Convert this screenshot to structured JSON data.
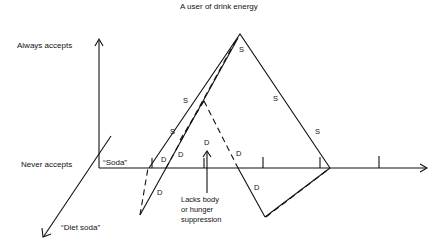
{
  "title": "A user of drink energy",
  "axes": {
    "y_top_label": "Always accepts",
    "y_bottom_label": "Never accepts",
    "x_label": "“Soda”",
    "z_label": "“Diet soda”"
  },
  "annotation": {
    "line1": "Lacks body",
    "line2": "or hunger",
    "line3": "suppression"
  },
  "markers": {
    "s": "S",
    "d": "D"
  }
}
